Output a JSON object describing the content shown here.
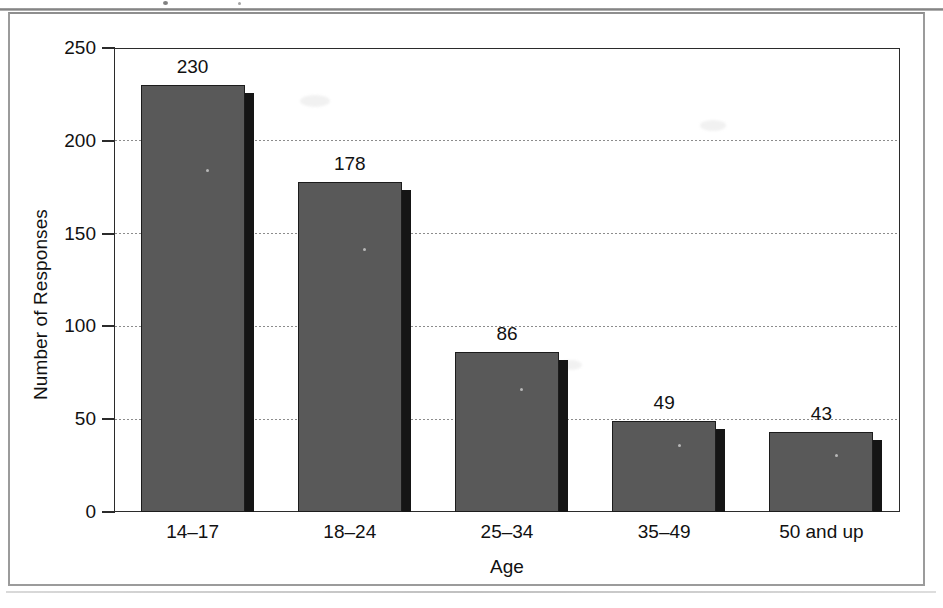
{
  "chart_data": {
    "type": "bar",
    "title": "",
    "subtitle": "",
    "xlabel": "Age",
    "ylabel": "Number of Responses",
    "categories": [
      "14–17",
      "18–24",
      "25–34",
      "35–49",
      "50 and up"
    ],
    "values": [
      230,
      178,
      86,
      49,
      43
    ],
    "value_labels": [
      "230",
      "178",
      "86",
      "49",
      "43"
    ],
    "ylim": [
      0,
      250
    ],
    "y_ticks": [
      250,
      200,
      150,
      100,
      50,
      0
    ],
    "y_tick_labels": [
      "250",
      "200",
      "150",
      "100",
      "50",
      "0"
    ],
    "grid": "horizontal-dotted",
    "legend": "none",
    "series": [
      {
        "name": "Number of Responses",
        "values": [
          230,
          178,
          86,
          49,
          43
        ]
      }
    ]
  },
  "style": {
    "bar_fill": "#595959",
    "bar_outline": "#1c1c1c",
    "bar_shadow": "#151515",
    "grid_color": "#8c8c8c",
    "axis_color": "#2b2b2b",
    "frame_color": "#9b9b9b",
    "background": "#ffffff",
    "text_color": "#111111"
  }
}
